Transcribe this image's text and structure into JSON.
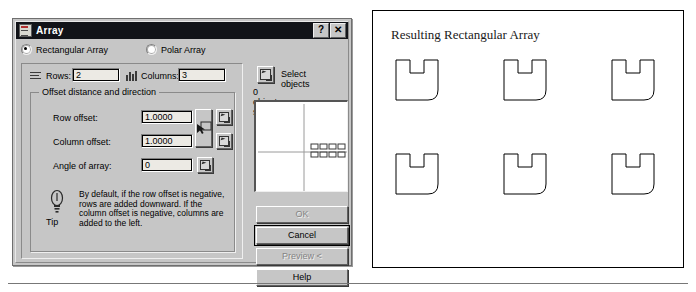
{
  "dialog": {
    "title": "Array",
    "icon": "array-window-icon",
    "help_button": "?",
    "close_button": "✕",
    "mode_options": [
      {
        "label": "Rectangular Array",
        "selected": true
      },
      {
        "label": "Polar Array",
        "selected": false
      }
    ],
    "rows": {
      "label": "Rows:",
      "value": "2",
      "icon": "rows-icon"
    },
    "columns": {
      "label": "Columns:",
      "value": "3",
      "icon": "columns-icon"
    },
    "offset_group": {
      "title": "Offset distance and direction",
      "fields": [
        {
          "label": "Row offset:",
          "value": "1.0000",
          "pick_icon": "pick-point-icon"
        },
        {
          "label": "Column offset:",
          "value": "1.0000",
          "pick_icon": "pick-point-icon"
        },
        {
          "label": "Angle of array:",
          "value": "0",
          "pick_icon": "pick-angle-icon"
        }
      ],
      "pick_both_icon": "pick-both-offsets-icon"
    },
    "tip": {
      "icon": "lightbulb-icon",
      "label": "Tip",
      "text": "By default, if the row offset is negative, rows are added downward.  If the column offset is negative, columns are added to the left."
    },
    "select": {
      "button_icon": "select-objects-icon",
      "button_label": "Select objects",
      "count_text": "0 objects selected"
    },
    "preview_pane": {
      "name": "array-preview",
      "rows": 2,
      "columns": 4
    },
    "buttons": [
      {
        "label": "OK",
        "enabled": false,
        "default": false
      },
      {
        "label": "Cancel",
        "enabled": true,
        "default": true
      },
      {
        "label": "Preview <",
        "enabled": false,
        "default": false
      },
      {
        "label": "Help",
        "enabled": true,
        "default": false
      }
    ]
  },
  "drawing": {
    "caption": "Resulting Rectangular Array",
    "rows": 2,
    "columns": 3,
    "shape_name": "u-slot-bracket",
    "shape_count": 6,
    "positions": [
      {
        "x": 22,
        "y": 48
      },
      {
        "x": 130,
        "y": 48
      },
      {
        "x": 238,
        "y": 48
      },
      {
        "x": 22,
        "y": 142
      },
      {
        "x": 130,
        "y": 142
      },
      {
        "x": 238,
        "y": 142
      }
    ]
  },
  "colors": {
    "dialog_face": "#c6c6c6",
    "titlebar": "#111318",
    "field_background": "#eceae4",
    "text": "#000000",
    "disabled_text": "#848484",
    "drawing_stroke": "#000000"
  }
}
